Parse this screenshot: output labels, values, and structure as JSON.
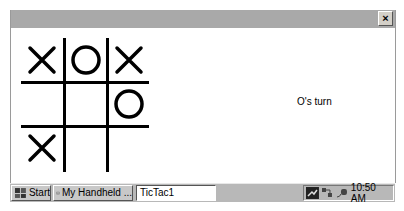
{
  "window": {
    "close_label": "×"
  },
  "game": {
    "board": [
      [
        "X",
        "O",
        "X"
      ],
      [
        "",
        "",
        "O"
      ],
      [
        "X",
        "",
        ""
      ]
    ],
    "status": "O's turn"
  },
  "taskbar": {
    "start_label": "Start",
    "handheld_label": "My Handheld ...",
    "active_app": "TicTac1",
    "clock": "10:50 AM",
    "tray_icons": [
      "network-icon",
      "sync-icon",
      "power-icon"
    ]
  }
}
